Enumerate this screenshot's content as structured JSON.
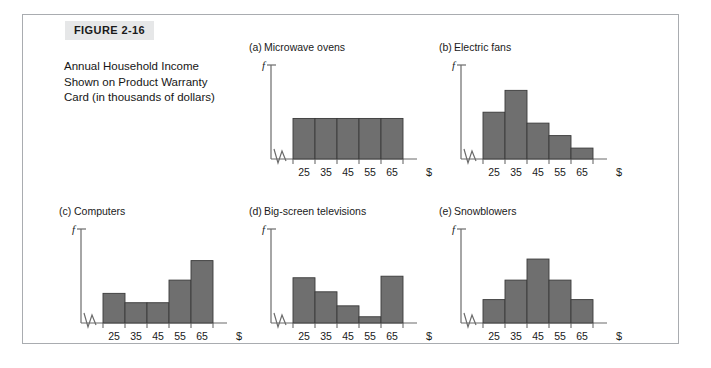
{
  "figure": {
    "badge": "FIGURE 2-16",
    "caption": "Annual Household Income Shown on Product Warranty Card (in thousands of dollars)",
    "caption_lines": [
      "Annual Household Income",
      "Shown on Product Warranty",
      "Card (in thousands of dollars)"
    ],
    "border_color": "#a9acb0",
    "badge_bg": "#e6e7e8",
    "bar_fill": "#6f6f6f",
    "bar_stroke": "#3a3a3a",
    "axis_color": "#6b6b6b"
  },
  "axis": {
    "y_label": "f",
    "x_unit_label": "$",
    "tick_labels": [
      "25",
      "35",
      "45",
      "55",
      "65"
    ]
  },
  "chart_data": [
    {
      "type": "bar",
      "panel": "a",
      "panel_label": "(a)",
      "title": "Microwave ovens",
      "categories": [
        "25",
        "35",
        "45",
        "55",
        "65"
      ],
      "values": [
        0.52,
        0.52,
        0.52,
        0.52,
        0.52
      ],
      "shape": "uniform / rectangular",
      "xlabel": "$",
      "ylabel": "f",
      "ylim": [
        0,
        1
      ],
      "grid": false,
      "axis_break": true
    },
    {
      "type": "bar",
      "panel": "b",
      "panel_label": "(b)",
      "title": "Electric fans",
      "categories": [
        "25",
        "35",
        "45",
        "55",
        "65"
      ],
      "values": [
        0.6,
        0.88,
        0.46,
        0.3,
        0.14
      ],
      "shape": "right-skewed",
      "xlabel": "$",
      "ylabel": "f",
      "ylim": [
        0,
        1
      ],
      "grid": false,
      "axis_break": true
    },
    {
      "type": "bar",
      "panel": "c",
      "panel_label": "(c)",
      "title": "Computers",
      "categories": [
        "25",
        "35",
        "45",
        "55",
        "65"
      ],
      "values": [
        0.38,
        0.26,
        0.26,
        0.55,
        0.8
      ],
      "shape": "left-skewed",
      "xlabel": "$",
      "ylabel": "f",
      "ylim": [
        0,
        1
      ],
      "grid": false,
      "axis_break": true
    },
    {
      "type": "bar",
      "panel": "d",
      "panel_label": "(d)",
      "title": "Big-screen televisions",
      "categories": [
        "25",
        "35",
        "45",
        "55",
        "65"
      ],
      "values": [
        0.58,
        0.4,
        0.22,
        0.08,
        0.6
      ],
      "shape": "bimodal / U-shaped",
      "xlabel": "$",
      "ylabel": "f",
      "ylim": [
        0,
        1
      ],
      "grid": false,
      "axis_break": true
    },
    {
      "type": "bar",
      "panel": "e",
      "panel_label": "(e)",
      "title": "Snowblowers",
      "categories": [
        "25",
        "35",
        "45",
        "55",
        "65"
      ],
      "values": [
        0.3,
        0.55,
        0.82,
        0.55,
        0.3
      ],
      "shape": "symmetric / bell-shaped",
      "xlabel": "$",
      "ylabel": "f",
      "ylim": [
        0,
        1
      ],
      "grid": false,
      "axis_break": true
    }
  ]
}
